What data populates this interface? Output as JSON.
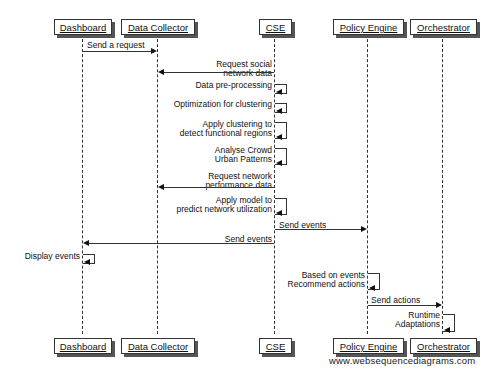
{
  "diagram": {
    "type": "sequence",
    "participants": [
      "Dashboard",
      "Data Collector",
      "CSE",
      "Policy Engine",
      "Orchestrator"
    ],
    "messages": [
      {
        "from": "Dashboard",
        "to": "Data Collector",
        "label": "Send a request"
      },
      {
        "from": "CSE",
        "to": "Data Collector",
        "label": "Request social network data",
        "lines": [
          "Request social",
          "network data"
        ]
      },
      {
        "from": "CSE",
        "to": "CSE",
        "label": "Data pre-processing"
      },
      {
        "from": "CSE",
        "to": "CSE",
        "label": "Optimization for clustering"
      },
      {
        "from": "CSE",
        "to": "CSE",
        "label": "Apply clustering to detect functional regions",
        "lines": [
          "Apply clustering to",
          "detect functional regions"
        ]
      },
      {
        "from": "CSE",
        "to": "CSE",
        "label": "Analyse Crowd Urban Patterns",
        "lines": [
          "Analyse Crowd",
          "Urban Patterns"
        ]
      },
      {
        "from": "CSE",
        "to": "Data Collector",
        "label": "Request network performance data",
        "lines": [
          "Request network",
          "performance data"
        ]
      },
      {
        "from": "CSE",
        "to": "CSE",
        "label": "Apply model to predict network utilization",
        "lines": [
          "Apply model to",
          "predict network utilization"
        ]
      },
      {
        "from": "CSE",
        "to": "Policy Engine",
        "label": "Send events"
      },
      {
        "from": "CSE",
        "to": "Dashboard",
        "label": "Send events"
      },
      {
        "from": "Dashboard",
        "to": "Dashboard",
        "label": "Display events"
      },
      {
        "from": "Policy Engine",
        "to": "Policy Engine",
        "label": "Based on events Recommend actions",
        "lines": [
          "Based on events",
          "Recommend actions"
        ]
      },
      {
        "from": "Policy Engine",
        "to": "Orchestrator",
        "label": "Send actions"
      },
      {
        "from": "Orchestrator",
        "to": "Orchestrator",
        "label": "Runtime Adaptations",
        "lines": [
          "Runtime",
          "Adaptations"
        ]
      }
    ],
    "watermark": "www.websequencediagrams.com"
  }
}
